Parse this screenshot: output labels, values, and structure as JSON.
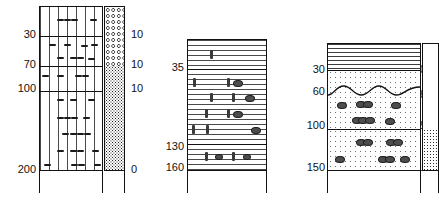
{
  "figure": {
    "type": "geological-log",
    "column_count": 3,
    "ink_color": "#111111",
    "hatch_color": "#4a4a4a",
    "symbol_color": "#3a3a3a"
  },
  "logs": [
    {
      "id": "log-1",
      "depth_labels_left": [
        "30",
        "70",
        "100",
        "200"
      ],
      "value_labels_right": [
        "10",
        "10",
        "10",
        "0"
      ],
      "beds": [
        {
          "name": "bed-1-a",
          "fill": "fill-vert",
          "top_depth": 0,
          "base_depth": 30
        },
        {
          "name": "bed-1-b",
          "fill": "fill-vert",
          "top_depth": 30,
          "base_depth": 70
        },
        {
          "name": "bed-1-c",
          "fill": "fill-vert",
          "top_depth": 70,
          "base_depth": 100
        },
        {
          "name": "bed-1-d",
          "fill": "fill-vert",
          "top_depth": 100,
          "base_depth": 200
        }
      ],
      "side_column": [
        {
          "name": "side-1-top",
          "fill": "fill-circles",
          "top_depth": 0,
          "base_depth": 70
        },
        {
          "name": "side-1-bot",
          "fill": "fill-stipple-vdense",
          "top_depth": 70,
          "base_depth": 200
        }
      ],
      "symbol": "dash",
      "symbol_meaning": "plant-debris-dash"
    },
    {
      "id": "log-2",
      "depth_labels_left": [
        "35",
        "130",
        "160"
      ],
      "value_labels_right": [],
      "beds": [
        {
          "name": "bed-2-a",
          "fill": "fill-horz",
          "top_depth": 0,
          "base_depth": 35
        },
        {
          "name": "bed-2-b",
          "fill": "fill-horz",
          "top_depth": 35,
          "base_depth": 130
        },
        {
          "name": "bed-2-c",
          "fill": "fill-horz",
          "top_depth": 130,
          "base_depth": 160
        }
      ],
      "side_column": [],
      "symbol": "bar-and-ellipse",
      "symbol_meaning": "shell-bar-and-nodule"
    },
    {
      "id": "log-3",
      "depth_labels_left": [
        "30",
        "60",
        "100",
        "150"
      ],
      "value_labels_right": [
        "0",
        "8",
        "2",
        "1"
      ],
      "beds": [
        {
          "name": "bed-3-a",
          "fill": "fill-horz-wide",
          "top_depth": 0,
          "base_depth": 30
        },
        {
          "name": "bed-3-b",
          "fill": "fill-stipple-fine",
          "top_depth": 30,
          "base_depth": 100
        },
        {
          "name": "bed-3-c",
          "fill": "fill-stipple-fine",
          "top_depth": 100,
          "base_depth": 150
        }
      ],
      "side_column": [
        {
          "name": "side-3-top",
          "fill": "fill-dotgrid",
          "top_depth": 0,
          "base_depth": 100
        },
        {
          "name": "side-3-bot",
          "fill": "fill-stipple-dense",
          "top_depth": 100,
          "base_depth": 150
        }
      ],
      "erosion_surface_depth": 60,
      "symbol": "ellipse",
      "symbol_meaning": "nodule-pebble"
    }
  ]
}
